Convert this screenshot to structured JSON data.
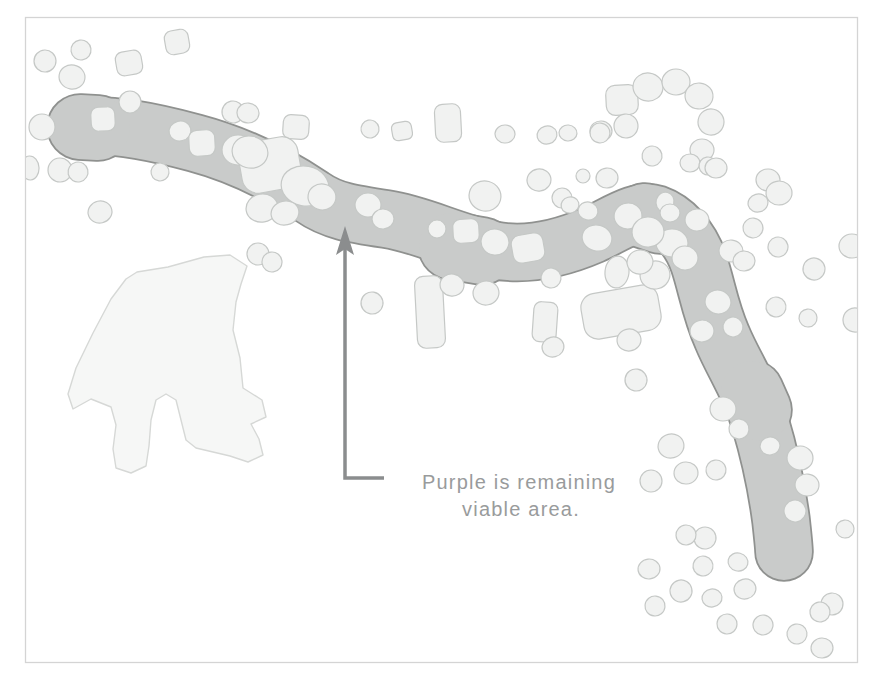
{
  "figure": {
    "kind": "scanned habitat buffer map",
    "annotation": {
      "line1": "Purple is remaining",
      "line2": "viable area."
    }
  },
  "colors": {
    "page_background": "#ffffff",
    "figure_border": "#d4d4d4",
    "corridor_fill": "#c9cbca",
    "corridor_outline": "#8f918f",
    "buffer_fill": "#f1f2f1",
    "buffer_outline": "#c5c8c6",
    "parcel_fill": "#f6f7f6",
    "parcel_outline": "#d6d8d6",
    "arrow": "#8b8d8e",
    "annotation_text": "#999b9c",
    "detail_mark": "#a5a7a6"
  }
}
